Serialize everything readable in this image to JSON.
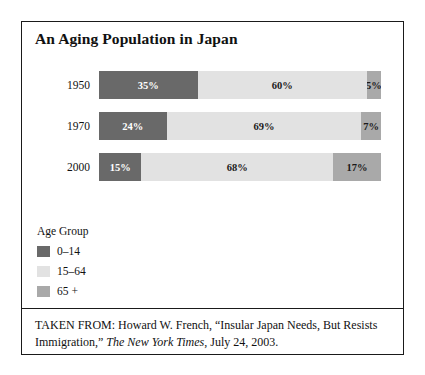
{
  "figure": {
    "title": "An Aging Population in Japan",
    "source_prefix": "TAKEN FROM: Howard W. French, “Insular Japan Needs, But Resists Immigration,” ",
    "source_publication": "The New York Times",
    "source_suffix": ", July 24, 2003."
  },
  "legend": {
    "title": "Age Group",
    "items": [
      {
        "label": "0–14",
        "color": "#696969"
      },
      {
        "label": "15–64",
        "color": "#e2e2e2"
      },
      {
        "label": "65 +",
        "color": "#a9a9a9"
      }
    ]
  },
  "chart_data": {
    "type": "bar",
    "orientation": "horizontal",
    "stacked": true,
    "stack_total": 100,
    "title": "An Aging Population in Japan",
    "xlabel": "",
    "ylabel": "",
    "xlim": [
      0,
      100
    ],
    "grid": false,
    "legend_position": "below-left",
    "categories": [
      "1950",
      "1970",
      "2000"
    ],
    "series": [
      {
        "name": "0–14",
        "color": "#696969",
        "values": [
          35,
          24,
          15
        ],
        "labels": [
          "35%",
          "24%",
          "15%"
        ]
      },
      {
        "name": "15–64",
        "color": "#e2e2e2",
        "values": [
          60,
          69,
          68
        ],
        "labels": [
          "60%",
          "69%",
          "68%"
        ]
      },
      {
        "name": "65 +",
        "color": "#a9a9a9",
        "values": [
          5,
          7,
          17
        ],
        "labels": [
          "5%",
          "7%",
          "17%"
        ]
      }
    ],
    "rows": [
      {
        "category": "1950",
        "segments": [
          {
            "series": "0–14",
            "value": 35,
            "label": "35%"
          },
          {
            "series": "15–64",
            "value": 60,
            "label": "60%"
          },
          {
            "series": "65 +",
            "value": 5,
            "label": "5%"
          }
        ]
      },
      {
        "category": "1970",
        "segments": [
          {
            "series": "0–14",
            "value": 24,
            "label": "24%"
          },
          {
            "series": "15–64",
            "value": 69,
            "label": "69%"
          },
          {
            "series": "65 +",
            "value": 7,
            "label": "7%"
          }
        ]
      },
      {
        "category": "2000",
        "segments": [
          {
            "series": "0–14",
            "value": 15,
            "label": "15%"
          },
          {
            "series": "15–64",
            "value": 68,
            "label": "68%"
          },
          {
            "series": "65 +",
            "value": 17,
            "label": "17%"
          }
        ]
      }
    ]
  }
}
